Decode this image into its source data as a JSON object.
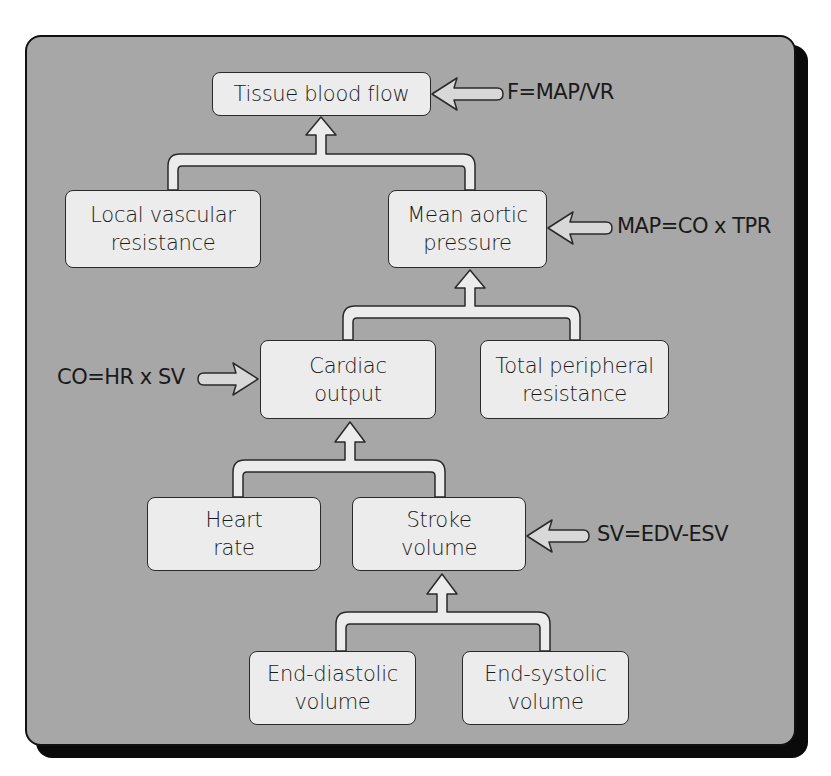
{
  "diagram": {
    "nodes": {
      "tissue_blood_flow": "Tissue blood flow",
      "local_vascular_resistance": "Local vascular\nresistance",
      "mean_aortic_pressure": "Mean aortic\npressure",
      "cardiac_output": "Cardiac\noutput",
      "total_peripheral_resistance": "Total peripheral\nresistance",
      "heart_rate": "Heart\nrate",
      "stroke_volume": "Stroke\nvolume",
      "end_diastolic_volume": "End-diastolic\nvolume",
      "end_systolic_volume": "End-systolic\nvolume"
    },
    "formulas": {
      "flow": "F=MAP/VR",
      "map": "MAP=CO x TPR",
      "co": "CO=HR x SV",
      "sv": "SV=EDV-ESV"
    },
    "edges": [
      {
        "from": [
          "local_vascular_resistance",
          "mean_aortic_pressure"
        ],
        "to": "tissue_blood_flow"
      },
      {
        "from": [
          "cardiac_output",
          "total_peripheral_resistance"
        ],
        "to": "mean_aortic_pressure"
      },
      {
        "from": [
          "heart_rate",
          "stroke_volume"
        ],
        "to": "cardiac_output"
      },
      {
        "from": [
          "end_diastolic_volume",
          "end_systolic_volume"
        ],
        "to": "stroke_volume"
      }
    ],
    "colors": {
      "panel": "#a7a7a7",
      "box_fill": "#ececec",
      "stroke": "#2a2a2a",
      "shadow": "#0a0a0a"
    }
  }
}
